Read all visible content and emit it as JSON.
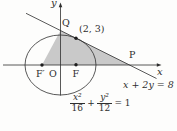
{
  "figure": {
    "axis": {
      "x_label": "x",
      "y_label": "y"
    },
    "points": {
      "q_label": "Q",
      "p_label": "P",
      "f_prime_label": "F′",
      "origin_label": "O",
      "f_label": "F",
      "tangent_point_label": "(2, 3)"
    },
    "equations": {
      "line": "x + 2y = 8",
      "ellipse": {
        "num1": "x²",
        "den1": "16",
        "plus": "+",
        "num2": "y²",
        "den2": "12",
        "rhs": "= 1"
      }
    },
    "colors": {
      "shade": "#c9c9c9",
      "stroke": "#2e2e2e",
      "background": "#fdfdfc"
    }
  }
}
